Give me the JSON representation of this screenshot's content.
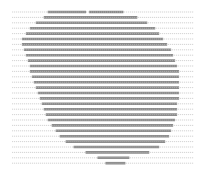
{
  "colors": {
    "background": "#ffffff",
    "guide_line": "#c8c8c8",
    "fill_band": "#8a8a8a",
    "fill_dot": "#b4b4b4"
  },
  "rows": [
    {
      "start": 0.24,
      "end": 0.62,
      "gap": 0.44
    },
    {
      "start": 0.22,
      "end": 0.69
    },
    {
      "start": 0.18,
      "end": 0.74
    },
    {
      "start": 0.15,
      "end": 0.78
    },
    {
      "start": 0.13,
      "end": 0.8
    },
    {
      "start": 0.11,
      "end": 0.82
    },
    {
      "start": 0.11,
      "end": 0.84
    },
    {
      "start": 0.12,
      "end": 0.86
    },
    {
      "start": 0.13,
      "end": 0.87
    },
    {
      "start": 0.14,
      "end": 0.88
    },
    {
      "start": 0.15,
      "end": 0.89
    },
    {
      "start": 0.15,
      "end": 0.9
    },
    {
      "start": 0.16,
      "end": 0.9
    },
    {
      "start": 0.17,
      "end": 0.9
    },
    {
      "start": 0.18,
      "end": 0.9
    },
    {
      "start": 0.19,
      "end": 0.9
    },
    {
      "start": 0.2,
      "end": 0.9
    },
    {
      "start": 0.21,
      "end": 0.89
    },
    {
      "start": 0.22,
      "end": 0.89
    },
    {
      "start": 0.23,
      "end": 0.89
    },
    {
      "start": 0.24,
      "end": 0.88
    },
    {
      "start": 0.26,
      "end": 0.87
    },
    {
      "start": 0.28,
      "end": 0.86
    },
    {
      "start": 0.3,
      "end": 0.85
    },
    {
      "start": 0.33,
      "end": 0.83
    },
    {
      "start": 0.37,
      "end": 0.8
    },
    {
      "start": 0.43,
      "end": 0.75
    },
    {
      "start": 0.49,
      "end": 0.65
    },
    {
      "start": 0.53,
      "end": 0.63
    }
  ]
}
